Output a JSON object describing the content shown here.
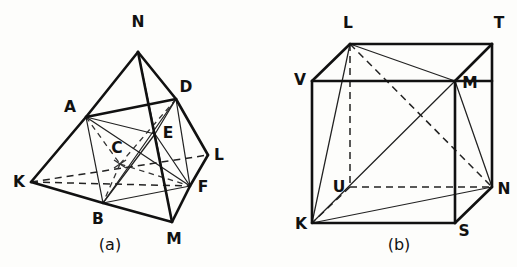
{
  "figure": {
    "background_color": "#fdfdfb",
    "line_color": "#111111",
    "panels": [
      {
        "id": "panel-a",
        "caption": "(a)",
        "caption_pos": {
          "x": 110,
          "y": 248
        },
        "type": "bipyramid-with-inscribed-tetrahedron",
        "vertices": [
          {
            "name": "N",
            "x": 138,
            "y": 52,
            "label": "N",
            "label_x": 138,
            "label_y": 27
          },
          {
            "name": "A",
            "x": 86,
            "y": 117,
            "label": "A",
            "label_x": 70,
            "label_y": 112
          },
          {
            "name": "D",
            "x": 176,
            "y": 99,
            "label": "D",
            "label_x": 186,
            "label_y": 92
          },
          {
            "name": "E",
            "x": 155,
            "y": 134,
            "label": "E",
            "label_x": 168,
            "label_y": 133
          },
          {
            "name": "C",
            "x": 120,
            "y": 164,
            "label": "C",
            "label_x": 117,
            "label_y": 153
          },
          {
            "name": "K",
            "x": 31,
            "y": 182,
            "label": "K",
            "label_x": 19,
            "label_y": 187
          },
          {
            "name": "L",
            "x": 208,
            "y": 155,
            "label": "L",
            "label_x": 219,
            "label_y": 155
          },
          {
            "name": "B",
            "x": 103,
            "y": 203,
            "label": "B",
            "label_x": 98,
            "label_y": 224
          },
          {
            "name": "F",
            "x": 190,
            "y": 186,
            "label": "F",
            "label_x": 203,
            "label_y": 188
          },
          {
            "name": "M",
            "x": 172,
            "y": 222,
            "label": "M",
            "label_x": 174,
            "label_y": 244
          }
        ],
        "solid_thick_edges": [
          [
            "N",
            "A"
          ],
          [
            "N",
            "D"
          ],
          [
            "N",
            "M"
          ],
          [
            "A",
            "K"
          ],
          [
            "A",
            "D"
          ],
          [
            "K",
            "B"
          ],
          [
            "B",
            "M"
          ],
          [
            "D",
            "L"
          ],
          [
            "L",
            "F"
          ],
          [
            "F",
            "M"
          ],
          [
            "D",
            "F"
          ]
        ],
        "solid_thin_edges": [
          [
            "A",
            "E"
          ],
          [
            "A",
            "B"
          ],
          [
            "A",
            "F"
          ],
          [
            "D",
            "E"
          ],
          [
            "E",
            "F"
          ],
          [
            "E",
            "B"
          ],
          [
            "E",
            "M"
          ],
          [
            "B",
            "F"
          ],
          [
            "B",
            "D"
          ],
          [
            "N",
            "E"
          ]
        ],
        "dashed_edges": [
          [
            "K",
            "L"
          ],
          [
            "K",
            "F"
          ],
          [
            "A",
            "C"
          ],
          [
            "C",
            "F"
          ],
          [
            "C",
            "D"
          ],
          [
            "C",
            "B"
          ]
        ],
        "cross_marks": [
          {
            "x": 120,
            "y": 164
          }
        ]
      },
      {
        "id": "panel-b",
        "caption": "(b)",
        "caption_pos": {
          "x": 399,
          "y": 248
        },
        "type": "cube-with-inscribed-tetrahedron",
        "vertices": [
          {
            "name": "L",
            "x": 350,
            "y": 44,
            "label": "L",
            "label_x": 348,
            "label_y": 27
          },
          {
            "name": "T",
            "x": 492,
            "y": 44,
            "label": "T",
            "label_x": 497,
            "label_y": 28
          },
          {
            "name": "V",
            "x": 312,
            "y": 81,
            "label": "V",
            "label_x": 300,
            "label_y": 79
          },
          {
            "name": "M",
            "x": 455,
            "y": 81,
            "label": "M",
            "label_x": 467,
            "label_y": 83
          },
          {
            "name": "U",
            "x": 350,
            "y": 187,
            "label": "U",
            "label_x": 340,
            "label_y": 185
          },
          {
            "name": "N",
            "x": 492,
            "y": 187,
            "label": "N",
            "label_x": 501,
            "label_y": 190
          },
          {
            "name": "K",
            "x": 312,
            "y": 223,
            "label": "K",
            "label_x": 301,
            "label_y": 227
          },
          {
            "name": "S",
            "x": 455,
            "y": 223,
            "label": "S",
            "label_x": 462,
            "label_y": 233
          }
        ],
        "solid_thick_edges": [
          [
            "V",
            "T"
          ],
          [
            "T",
            "N"
          ],
          [
            "N",
            "S"
          ],
          [
            "S",
            "K"
          ],
          [
            "K",
            "V"
          ],
          [
            "V",
            "M"
          ],
          [
            "M",
            "T"
          ],
          [
            "M",
            "N"
          ],
          [
            "L",
            "V"
          ],
          [
            "L",
            "T"
          ]
        ],
        "solid_thin_edges": [
          [
            "L",
            "K"
          ],
          [
            "L",
            "M"
          ],
          [
            "K",
            "M"
          ],
          [
            "K",
            "N"
          ],
          [
            "M",
            "N"
          ]
        ],
        "dashed_edges": [
          [
            "L",
            "U"
          ],
          [
            "U",
            "K"
          ],
          [
            "U",
            "N"
          ],
          [
            "L",
            "N"
          ]
        ]
      }
    ]
  }
}
